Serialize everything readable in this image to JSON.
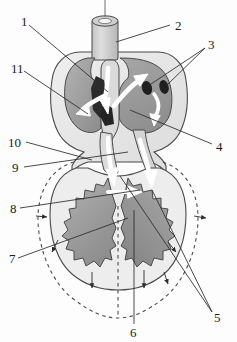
{
  "figure": {
    "kind": "labeled-anatomical-diagram",
    "style": "grayscale line drawing with airflow arrows",
    "canvas": {
      "width": 237,
      "height": 342
    }
  },
  "palette": {
    "background": "#fdfdfd",
    "outline": "#3a3a3a",
    "leader_line": "#2b2b2b",
    "label_text": "#1b1b1b",
    "organ_mid_gray": "#9a9a9a",
    "organ_light_gray": "#c9c9c9",
    "organ_pale_gray": "#e2e2e2",
    "organ_dark_gray": "#7d7d7d",
    "cavity_dark": "#2a2a2a",
    "flow_arrow": "#ffffff",
    "dashed_outline": "#4a4a4a"
  },
  "labels": [
    {
      "id": "1",
      "text": "1",
      "x": 21,
      "y": 22,
      "side": "left"
    },
    {
      "id": "2",
      "text": "2",
      "x": 175,
      "y": 26,
      "side": "right"
    },
    {
      "id": "3",
      "text": "3",
      "x": 208,
      "y": 45,
      "side": "right"
    },
    {
      "id": "4",
      "text": "4",
      "x": 216,
      "y": 147,
      "side": "right"
    },
    {
      "id": "5",
      "text": "5",
      "x": 214,
      "y": 318,
      "side": "right"
    },
    {
      "id": "6",
      "text": "6",
      "x": 134,
      "y": 330,
      "side": "bottom"
    },
    {
      "id": "7",
      "text": "7",
      "x": 11,
      "y": 260,
      "side": "left"
    },
    {
      "id": "8",
      "text": "8",
      "x": 12,
      "y": 210,
      "side": "left"
    },
    {
      "id": "9",
      "text": "9",
      "x": 14,
      "y": 170,
      "side": "left"
    },
    {
      "id": "10",
      "text": "10",
      "x": 10,
      "y": 145,
      "side": "left"
    },
    {
      "id": "11",
      "text": "11",
      "x": 13,
      "y": 70,
      "side": "left"
    }
  ],
  "structures": [
    {
      "name": "trachea",
      "note": "vertical tube entering from top center"
    },
    {
      "name": "heart-cavity",
      "note": "large upper chamber mass, mid gray"
    },
    {
      "name": "bronchi-openings",
      "note": "two dark ovals on right of upper chamber"
    },
    {
      "name": "left-lung",
      "note": "lower-left lobe with jagged margin"
    },
    {
      "name": "right-lung",
      "note": "lower-right lobe with jagged margin"
    },
    {
      "name": "diaphragm-outline",
      "note": "dashed expanded outline around lower cavity"
    },
    {
      "name": "airflow-arrows",
      "note": "white arrows showing air movement"
    },
    {
      "name": "expansion-arrows",
      "note": "small dark arrows pointing outward/downward"
    }
  ]
}
